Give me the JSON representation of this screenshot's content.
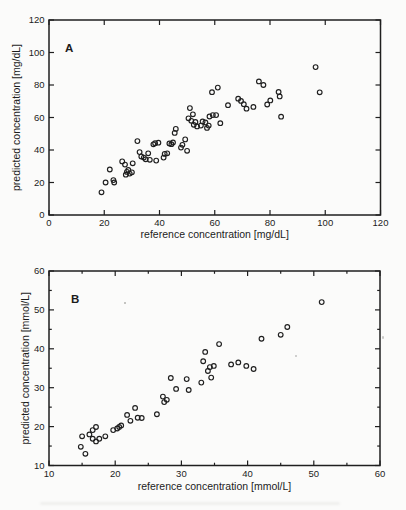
{
  "figure": {
    "background": "#fbfbfa",
    "ink_color": "#1f1f1f",
    "panel_count": 2
  },
  "chart_data": [
    {
      "type": "scatter",
      "panel_label": "A",
      "xlabel": "reference concentration [mg/dL]",
      "ylabel": "predicted concentration [mg/dL]",
      "xlim": [
        0,
        120
      ],
      "ylim": [
        0,
        120
      ],
      "xticks": [
        0,
        20,
        40,
        60,
        80,
        100,
        120
      ],
      "yticks": [
        0,
        20,
        40,
        60,
        80,
        100,
        120
      ],
      "xminor": [],
      "yminor": [],
      "grid": false,
      "legend": null,
      "marker": "open-circle",
      "points": [
        [
          19,
          14
        ],
        [
          20.5,
          20
        ],
        [
          22,
          28
        ],
        [
          23.3,
          21.5
        ],
        [
          23.6,
          20
        ],
        [
          26.5,
          33
        ],
        [
          27.5,
          31
        ],
        [
          27.8,
          24.8
        ],
        [
          28.2,
          26.5
        ],
        [
          28.7,
          27.7
        ],
        [
          29.2,
          25.5
        ],
        [
          30,
          26.3
        ],
        [
          30.3,
          31.8
        ],
        [
          32,
          45.5
        ],
        [
          32.8,
          38.7
        ],
        [
          33.4,
          36
        ],
        [
          34.3,
          35.3
        ],
        [
          35,
          34.3
        ],
        [
          35.9,
          38
        ],
        [
          36.5,
          34
        ],
        [
          37.8,
          43.5
        ],
        [
          38.4,
          44.2
        ],
        [
          38.8,
          33.5
        ],
        [
          39.6,
          44.5
        ],
        [
          41.5,
          35.3
        ],
        [
          41.9,
          37.6
        ],
        [
          42.8,
          38
        ],
        [
          43.6,
          44
        ],
        [
          44.3,
          43.6
        ],
        [
          44.9,
          44.6
        ],
        [
          45.5,
          50.5
        ],
        [
          45.9,
          53
        ],
        [
          47.8,
          41.5
        ],
        [
          48.3,
          43.2
        ],
        [
          49.3,
          46.5
        ],
        [
          50,
          39.5
        ],
        [
          50.5,
          59.5
        ],
        [
          51,
          65.8
        ],
        [
          51.5,
          58
        ],
        [
          52.1,
          62
        ],
        [
          52.4,
          55.5
        ],
        [
          53,
          57.2
        ],
        [
          53.6,
          54.5
        ],
        [
          55,
          55
        ],
        [
          55.6,
          57.6
        ],
        [
          56.6,
          57
        ],
        [
          57.2,
          53.6
        ],
        [
          57.8,
          55
        ],
        [
          58.1,
          60.6
        ],
        [
          59,
          75.6
        ],
        [
          59.3,
          61.5
        ],
        [
          60.5,
          61.5
        ],
        [
          61.1,
          78.4
        ],
        [
          62,
          56.5
        ],
        [
          64.8,
          67.6
        ],
        [
          68.5,
          71.6
        ],
        [
          69.5,
          70.2
        ],
        [
          70.5,
          68.2
        ],
        [
          71.5,
          65.4
        ],
        [
          74,
          66.5
        ],
        [
          76,
          82.2
        ],
        [
          77.6,
          80
        ],
        [
          79,
          68
        ],
        [
          80.1,
          70.5
        ],
        [
          83.1,
          75.7
        ],
        [
          83.5,
          73
        ],
        [
          84,
          60.5
        ],
        [
          96.5,
          91
        ],
        [
          98,
          75.5
        ]
      ]
    },
    {
      "type": "scatter",
      "panel_label": "B",
      "xlabel": "reference concentration [mmol/L]",
      "ylabel": "predicted concentration [mmol/L]",
      "xlim": [
        10,
        60
      ],
      "ylim": [
        10,
        60
      ],
      "xticks": [
        10,
        20,
        30,
        40,
        50,
        60
      ],
      "yticks": [
        10,
        20,
        30,
        40,
        50,
        60
      ],
      "xminor": [
        15,
        25,
        35,
        45,
        55
      ],
      "yminor": [
        15,
        25,
        35,
        45,
        55
      ],
      "grid": false,
      "legend": null,
      "marker": "open-circle",
      "points": [
        [
          15,
          17.5
        ],
        [
          14.8,
          14.8
        ],
        [
          15.5,
          13
        ],
        [
          16.1,
          18
        ],
        [
          16.6,
          19.1
        ],
        [
          16.6,
          16.9
        ],
        [
          17.1,
          19.9
        ],
        [
          17.1,
          16.2
        ],
        [
          17.6,
          16.9
        ],
        [
          18.5,
          17.5
        ],
        [
          19.7,
          19.1
        ],
        [
          20.3,
          19.5
        ],
        [
          20.6,
          19.9
        ],
        [
          20.9,
          20.3
        ],
        [
          21.8,
          23
        ],
        [
          22.3,
          21.5
        ],
        [
          23,
          24.8
        ],
        [
          23.4,
          22.3
        ],
        [
          24,
          22.2
        ],
        [
          26.3,
          23.2
        ],
        [
          27.2,
          27.7
        ],
        [
          27.4,
          26.3
        ],
        [
          27.8,
          26.9
        ],
        [
          28.4,
          32.5
        ],
        [
          29.2,
          29.7
        ],
        [
          30.8,
          32.2
        ],
        [
          31.1,
          29.4
        ],
        [
          33,
          31.3
        ],
        [
          33.3,
          36.8
        ],
        [
          33.6,
          39.2
        ],
        [
          34,
          34.3
        ],
        [
          34.3,
          35.3
        ],
        [
          34.5,
          32.6
        ],
        [
          34.9,
          35.6
        ],
        [
          35.7,
          41.2
        ],
        [
          37.5,
          36
        ],
        [
          38.6,
          36.5
        ],
        [
          39.8,
          35.6
        ],
        [
          40.9,
          34.8
        ],
        [
          42.1,
          42.6
        ],
        [
          45,
          43.6
        ],
        [
          46,
          45.6
        ],
        [
          51.2,
          52
        ]
      ]
    }
  ]
}
